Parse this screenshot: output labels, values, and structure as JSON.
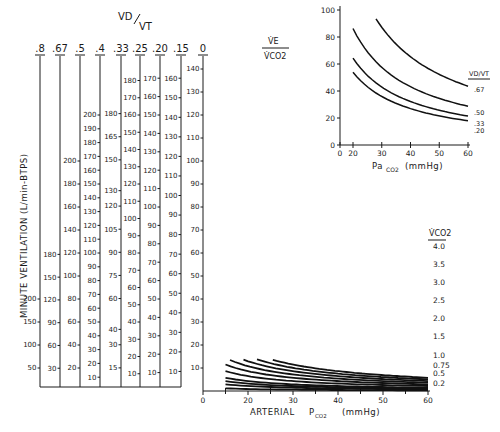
{
  "chart_data": [
    {
      "type": "line",
      "name": "main-nomogram",
      "title": "",
      "xlabel": "ARTERIAL PCO2 (mmHg)",
      "ylabel": "MINUTE VENTILATION (L/min-BTPS)",
      "x_ticks": [
        0,
        20,
        30,
        40,
        50,
        60
      ],
      "x_minor_ticks": [
        15,
        25,
        35,
        45,
        55
      ],
      "xlim": [
        15,
        60
      ],
      "ylim": [
        0,
        140
      ],
      "grid": false,
      "legend_title": "V̇CO2",
      "legend_position": "right",
      "formula": "VE = 0.863 * VCO2(ml) / (PaCO2 * (1 - VD/VT)) ; curves drawn for VD/VT = 0",
      "series": [
        {
          "name": "0.2",
          "vco2": 0.2,
          "x": [
            15,
            20,
            30,
            40,
            50,
            60
          ],
          "values": [
            11.5,
            8.6,
            5.8,
            4.3,
            3.5,
            2.9
          ]
        },
        {
          "name": "0.5",
          "vco2": 0.5,
          "x": [
            15,
            20,
            30,
            40,
            50,
            60
          ],
          "values": [
            28.8,
            21.6,
            14.4,
            10.8,
            8.6,
            7.2
          ]
        },
        {
          "name": "0.75",
          "vco2": 0.75,
          "x": [
            15,
            20,
            30,
            40,
            50,
            60
          ],
          "values": [
            43.2,
            32.4,
            21.6,
            16.2,
            12.9,
            10.8
          ]
        },
        {
          "name": "1.0",
          "vco2": 1.0,
          "x": [
            15,
            20,
            30,
            40,
            50,
            60
          ],
          "values": [
            57.5,
            43.2,
            28.8,
            21.6,
            17.3,
            14.4
          ]
        },
        {
          "name": "1.5",
          "vco2": 1.5,
          "x": [
            15,
            20,
            30,
            40,
            50,
            60
          ],
          "values": [
            86.3,
            64.7,
            43.2,
            32.4,
            25.9,
            21.6
          ]
        },
        {
          "name": "2.0",
          "vco2": 2.0,
          "x": [
            15,
            20,
            30,
            40,
            50,
            60
          ],
          "values": [
            115.1,
            86.3,
            57.5,
            43.2,
            34.5,
            28.8
          ]
        },
        {
          "name": "2.5",
          "vco2": 2.5,
          "x": [
            16,
            20,
            30,
            40,
            50,
            60
          ],
          "values": [
            134.8,
            107.9,
            71.9,
            53.9,
            43.2,
            36.0
          ]
        },
        {
          "name": "3.0",
          "vco2": 3.0,
          "x": [
            19,
            20,
            30,
            40,
            50,
            60
          ],
          "values": [
            136.3,
            129.5,
            86.3,
            64.7,
            51.8,
            43.2
          ]
        },
        {
          "name": "3.5",
          "vco2": 3.5,
          "x": [
            22,
            30,
            40,
            50,
            60
          ],
          "values": [
            137.3,
            100.7,
            75.5,
            60.4,
            50.3
          ]
        },
        {
          "name": "4.0",
          "vco2": 4.0,
          "x": [
            25.5,
            30,
            40,
            50,
            60
          ],
          "values": [
            135.4,
            115.1,
            86.3,
            69.0,
            57.5
          ]
        }
      ],
      "nomogram_scales": {
        "header": "VD/VT",
        "columns": [
          {
            "vdvt": ".8",
            "ticks": [
              50,
              100,
              150,
              200
            ]
          },
          {
            "vdvt": ".67",
            "ticks": [
              30,
              60,
              90,
              120,
              150,
              180
            ]
          },
          {
            "vdvt": ".5",
            "ticks": [
              20,
              40,
              60,
              80,
              100,
              120,
              140,
              160,
              180,
              200
            ]
          },
          {
            "vdvt": ".4",
            "ticks": [
              10,
              20,
              30,
              40,
              50,
              60,
              70,
              80,
              90,
              100,
              110,
              120,
              130,
              140,
              150,
              160,
              170,
              180,
              190,
              200
            ]
          },
          {
            "vdvt": ".33",
            "ticks": [
              15,
              30,
              40,
              60,
              75,
              90,
              105,
              120,
              130,
              150,
              165,
              180
            ]
          },
          {
            "vdvt": ".25",
            "ticks": [
              10,
              20,
              30,
              40,
              50,
              60,
              70,
              80,
              90,
              100,
              110,
              120,
              130,
              140,
              150,
              160,
              170,
              180
            ]
          },
          {
            "vdvt": ".20",
            "ticks": [
              10,
              20,
              30,
              40,
              50,
              60,
              70,
              80,
              90,
              100,
              110,
              120,
              130,
              140,
              150,
              160,
              170
            ]
          },
          {
            "vdvt": ".15",
            "ticks": [
              10,
              20,
              30,
              40,
              50,
              60,
              70,
              80,
              90,
              100,
              110,
              120,
              130,
              140,
              150,
              160
            ]
          },
          {
            "vdvt": "0",
            "ticks": [
              10,
              20,
              30,
              40,
              50,
              60,
              70,
              80,
              90,
              100,
              110,
              120,
              130,
              140
            ]
          }
        ]
      }
    },
    {
      "type": "line",
      "name": "inset-ve-vco2",
      "title": "",
      "xlabel": "PaCO2 (mmHg)",
      "ylabel": "V̇E / V̇CO2",
      "x_ticks": [
        0,
        20,
        30,
        40,
        50,
        60
      ],
      "y_ticks": [
        0,
        20,
        40,
        60,
        80,
        100
      ],
      "xlim": [
        20,
        60
      ],
      "ylim": [
        0,
        100
      ],
      "grid": false,
      "legend_title": "VD/VT",
      "legend_position": "right",
      "series": [
        {
          "name": ".20",
          "x": [
            20,
            30,
            40,
            50,
            60
          ],
          "values": [
            54,
            36,
            27,
            21.6,
            18
          ]
        },
        {
          "name": ".33",
          "x": [
            20,
            30,
            40,
            50,
            60
          ],
          "values": [
            64.4,
            42.9,
            32.2,
            25.8,
            21.5
          ]
        },
        {
          "name": ".50",
          "x": [
            20,
            30,
            40,
            50,
            60
          ],
          "values": [
            86.3,
            57.5,
            43.2,
            34.5,
            28.8
          ]
        },
        {
          "name": ".67",
          "x": [
            28,
            30,
            40,
            50,
            60
          ],
          "values": [
            93.5,
            87.2,
            65.4,
            52.3,
            43.6
          ]
        }
      ]
    }
  ],
  "labels": {
    "header_vd": "VD",
    "header_vt": "VT",
    "y_axis_title": "MINUTE VENTILATION (L/min-BTPS)",
    "x_axis_title": "ARTERIAL",
    "x_axis_pco2": "P",
    "x_axis_sub": "CO2",
    "x_axis_units": "(mmHg)",
    "legend_vco2": "V̇CO2",
    "inset_ratio_top": "V̇E",
    "inset_ratio_bottom": "V̇CO2",
    "inset_xlabel_pa": "Pa",
    "inset_xlabel_sub": "CO2",
    "inset_xlabel_units": "(mmHg)",
    "inset_legend_vd": "VD/VT"
  }
}
